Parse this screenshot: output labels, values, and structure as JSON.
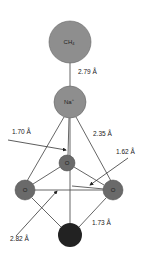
{
  "diagram": {
    "colors": {
      "large_atom": "#8e8e8e",
      "o_atom": "#6a6a6a",
      "bottom_atom": "#222222",
      "bond": "#555555"
    },
    "atoms": {
      "ch4": {
        "label": "CH",
        "subscript": "4"
      },
      "na": {
        "label": "Na",
        "superscript": "+"
      },
      "o_top": {
        "label": "O"
      },
      "o_left": {
        "label": "O"
      },
      "o_right": {
        "label": "O"
      },
      "bottom": {
        "label": "Si"
      }
    },
    "distances": {
      "ch4_na": "2.79 Å",
      "d1": "1.70 Å",
      "d2": "2.35 Å",
      "d3": "1.62 Å",
      "d4": "2.82 Å",
      "d5": "1.73 Å"
    }
  }
}
